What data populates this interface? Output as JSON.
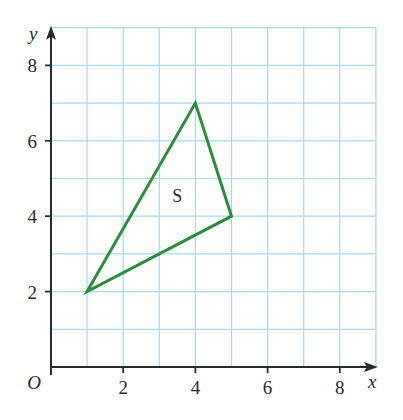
{
  "chart_data": {
    "type": "scatter",
    "title": "",
    "xlabel": "x",
    "ylabel": "y",
    "origin_label": "O",
    "xlim": [
      0,
      9
    ],
    "ylim": [
      0,
      9
    ],
    "x_ticks": [
      2,
      4,
      6,
      8
    ],
    "y_ticks": [
      2,
      4,
      6,
      8
    ],
    "grid": true,
    "shapes": [
      {
        "name": "S",
        "type": "triangle",
        "vertices": [
          [
            1,
            2
          ],
          [
            4,
            7
          ],
          [
            5,
            4
          ]
        ],
        "label_position": [
          3.5,
          4.5
        ]
      }
    ]
  },
  "colors": {
    "grid": "#a8d8ee",
    "axis": "#2a2a2a",
    "shape": "#2e8b3e"
  }
}
